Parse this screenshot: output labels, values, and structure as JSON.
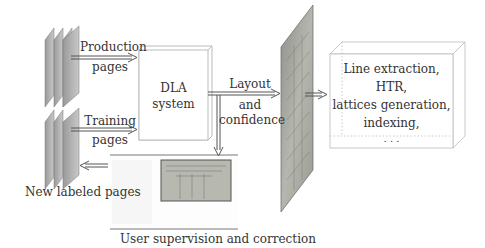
{
  "labels": {
    "production_1": "Production",
    "production_2": "pages",
    "training_1": "Training",
    "training_2": "pages",
    "new_labeled": "New labeled pages",
    "dla_1": "DLA",
    "dla_2": "system",
    "layout_1": "Layout",
    "layout_2": "and",
    "layout_3": "confidence",
    "supervision": "User supervision and correction",
    "processing_1": "Line extraction,",
    "processing_2": "HTR,",
    "processing_3": "lattices generation,",
    "processing_4": "indexing,",
    "processing_5": ". . ."
  },
  "colors": {
    "page_gray": "#a8a8a8",
    "line": "#555555",
    "box_border": "#bbbbbb"
  }
}
